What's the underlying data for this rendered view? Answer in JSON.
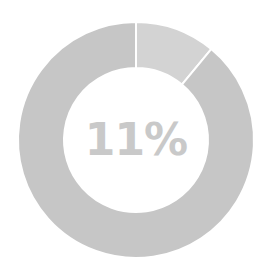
{
  "chart_data": {
    "type": "pie",
    "variant": "donut",
    "categories": [
      "Highlighted",
      "Remainder"
    ],
    "values": [
      11,
      89
    ],
    "unit": "%",
    "center_label": "11%",
    "colors": [
      "#d3d3d3",
      "#c6c6c6"
    ],
    "separator_color": "#ffffff",
    "start_angle_deg": 0,
    "direction": "clockwise",
    "title": "",
    "legend": "none"
  },
  "label": {
    "text": "11%"
  },
  "colors": {
    "text": "#c9c9c9",
    "background": "#ffffff"
  }
}
